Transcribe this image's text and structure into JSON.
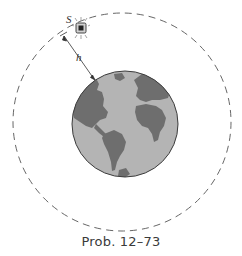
{
  "figure": {
    "caption": "Prob. 12–73",
    "labels": {
      "satellite": "S",
      "altitude": "h"
    },
    "colors": {
      "ocean": "#b4b4b4",
      "land": "#6e6e6e",
      "orbit": "#555555",
      "outline": "#3c3c3c"
    },
    "icons": [
      "satellite-icon",
      "earth-globe"
    ]
  }
}
